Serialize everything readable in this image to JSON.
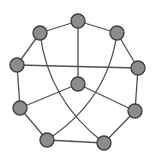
{
  "diagram": {
    "type": "graph",
    "title": "",
    "colors": {
      "node_fill": "#8c8c8c",
      "node_stroke": "#3f3f3f",
      "edge": "#505050",
      "background": "#ffffff"
    },
    "node_radius": 7,
    "nodes": [
      {
        "id": "top",
        "x": 78,
        "y": 21
      },
      {
        "id": "upper-left",
        "x": 40,
        "y": 33
      },
      {
        "id": "upper-right",
        "x": 117,
        "y": 33
      },
      {
        "id": "left",
        "x": 17,
        "y": 65
      },
      {
        "id": "right",
        "x": 138,
        "y": 68
      },
      {
        "id": "center",
        "x": 78,
        "y": 84
      },
      {
        "id": "lower-left",
        "x": 20,
        "y": 108
      },
      {
        "id": "lower-right",
        "x": 135,
        "y": 111
      },
      {
        "id": "bottom-left",
        "x": 47,
        "y": 140
      },
      {
        "id": "bottom-right",
        "x": 104,
        "y": 143
      }
    ],
    "edges": [
      {
        "from": "top",
        "to": "upper-left",
        "curve": null
      },
      {
        "from": "top",
        "to": "upper-right",
        "curve": null
      },
      {
        "from": "top",
        "to": "center",
        "curve": null
      },
      {
        "from": "upper-left",
        "to": "left",
        "curve": null
      },
      {
        "from": "upper-right",
        "to": "right",
        "curve": null
      },
      {
        "from": "left",
        "to": "right",
        "curve": null
      },
      {
        "from": "left",
        "to": "lower-left",
        "curve": null
      },
      {
        "from": "right",
        "to": "lower-right",
        "curve": null
      },
      {
        "from": "center",
        "to": "lower-left",
        "curve": null
      },
      {
        "from": "center",
        "to": "lower-right",
        "curve": null
      },
      {
        "from": "lower-left",
        "to": "bottom-left",
        "curve": null
      },
      {
        "from": "lower-right",
        "to": "bottom-right",
        "curve": null
      },
      {
        "from": "bottom-left",
        "to": "bottom-right",
        "curve": null
      },
      {
        "from": "upper-left",
        "to": "bottom-right",
        "curve": {
          "cx": 48,
          "cy": 100
        }
      },
      {
        "from": "upper-right",
        "to": "bottom-left",
        "curve": {
          "cx": 108,
          "cy": 100
        }
      }
    ]
  }
}
